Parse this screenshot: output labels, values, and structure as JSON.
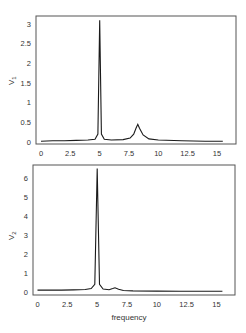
{
  "chart_data": [
    {
      "type": "line",
      "title": "",
      "xlabel": "",
      "ylabel": "V1",
      "xlim": [
        -0.4,
        16.6
      ],
      "ylim": [
        0,
        3.2
      ],
      "grid": false,
      "xticks": [
        "0",
        "2.5",
        "5",
        "7.5",
        "10",
        "12.5",
        "15"
      ],
      "yticks": [
        "0",
        "0.5",
        "1",
        "1.5",
        "2",
        "2.5",
        "3"
      ],
      "series": [
        {
          "name": "V1",
          "x": [
            0,
            1,
            2,
            3,
            4,
            4.6,
            4.85,
            5.0,
            5.15,
            5.4,
            6,
            7,
            7.6,
            7.9,
            8.1,
            8.25,
            8.4,
            8.7,
            9.2,
            10,
            12,
            14,
            15.5
          ],
          "y": [
            0.02,
            0.03,
            0.03,
            0.04,
            0.05,
            0.07,
            0.2,
            3.1,
            0.2,
            0.07,
            0.05,
            0.06,
            0.1,
            0.2,
            0.35,
            0.45,
            0.35,
            0.18,
            0.08,
            0.05,
            0.03,
            0.02,
            0.02
          ]
        }
      ]
    },
    {
      "type": "line",
      "title": "",
      "xlabel": "frequency",
      "ylabel": "V2",
      "xlim": [
        -0.4,
        16.6
      ],
      "ylim": [
        0,
        6.7
      ],
      "grid": false,
      "xticks": [
        "0",
        "2.5",
        "5",
        "7.5",
        "10",
        "12.5",
        "15"
      ],
      "yticks": [
        "0",
        "1",
        "2",
        "3",
        "4",
        "5",
        "6"
      ],
      "series": [
        {
          "name": "V2",
          "x": [
            0,
            1,
            2,
            3,
            4,
            4.5,
            4.8,
            5.0,
            5.2,
            5.5,
            6.0,
            6.3,
            6.5,
            6.8,
            7.2,
            8,
            10,
            12,
            14,
            15.5
          ],
          "y": [
            0.1,
            0.1,
            0.1,
            0.11,
            0.13,
            0.18,
            0.4,
            6.5,
            0.4,
            0.15,
            0.12,
            0.18,
            0.22,
            0.14,
            0.08,
            0.06,
            0.05,
            0.04,
            0.04,
            0.04
          ]
        }
      ]
    }
  ],
  "panels": {
    "top": {
      "ylabel": "V",
      "ylabel_sub": "1"
    },
    "bottom": {
      "ylabel": "V",
      "ylabel_sub": "2",
      "xlabel": "frequency"
    }
  },
  "colors": {
    "line": "#1a1a1a",
    "frame": "#555555",
    "text": "#333333"
  }
}
